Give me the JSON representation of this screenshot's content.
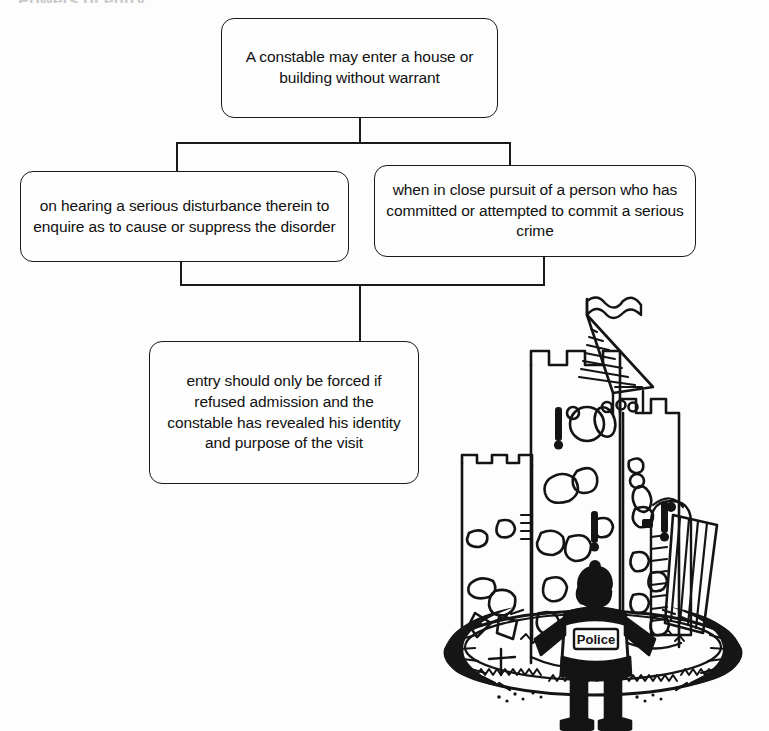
{
  "diagram": {
    "title_cutoff": "Powers of entry",
    "type": "flowchart",
    "nodes": {
      "root": {
        "id": "root",
        "text": "A constable may enter a house or building without warrant",
        "role": "root-condition"
      },
      "branch_left": {
        "id": "branch-left",
        "text": "on hearing a serious disturbance therein to enquire as to cause or suppress the disorder",
        "role": "branch"
      },
      "branch_right": {
        "id": "branch-right",
        "text": "when in close pursuit of a person who has committed or attempted to commit a serious crime",
        "role": "branch"
      },
      "note": {
        "id": "note",
        "text": "entry should only be forced if refused admission and the constable has revealed his identity and purpose of the visit",
        "role": "qualifier-note"
      }
    },
    "edges": [
      {
        "from": "root",
        "to": "branch-left",
        "style": "orthogonal"
      },
      {
        "from": "root",
        "to": "branch-right",
        "style": "orthogonal"
      },
      {
        "from": "branch-left",
        "to": "note",
        "style": "orthogonal"
      },
      {
        "from": "branch-right",
        "to": "note",
        "style": "orthogonal"
      }
    ],
    "colors": {
      "background": "#fdfdfd",
      "ink": "#1a1a1a",
      "box_fill": "#fefefe"
    }
  },
  "illustration": {
    "name": "castle-with-policeman",
    "description": "Line-drawn stone castle keep with battlements, flag on conical turret, drawbridge and surrounding moat, with a policeman standing in front, hands on hips",
    "labels": {
      "vest_text": "Police"
    },
    "parts": [
      "main-keep-tower",
      "left-battlement-tower",
      "right-battlement-tower",
      "conical-turret-roof",
      "pennant-flag",
      "drawbridge-door",
      "moat-ring",
      "grass-texture",
      "policeman-figure"
    ]
  }
}
